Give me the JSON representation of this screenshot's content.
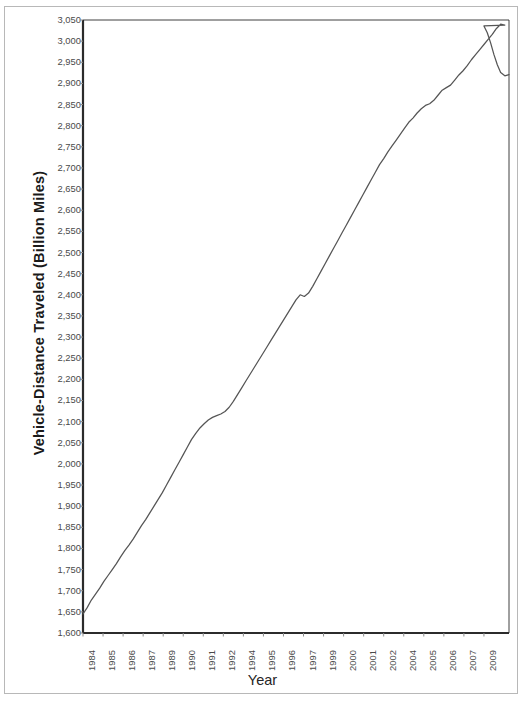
{
  "chart_data": {
    "type": "line",
    "title": "",
    "xlabel": "Year",
    "ylabel": "Vehicle-Distance Traveled (Billion Miles)",
    "ylim": [
      1600,
      3050
    ],
    "xlim": [
      1984,
      2009.5
    ],
    "ytick_step": 50,
    "grid": false,
    "legend": null,
    "ytick_labels": [
      "3,050",
      "3,000",
      "2,950",
      "2,900",
      "2,850",
      "2,800",
      "2,750",
      "2,700",
      "2,650",
      "2,600",
      "2,550",
      "2,500",
      "2,450",
      "2,400",
      "2,350",
      "2,300",
      "2,250",
      "2,200",
      "2,150",
      "2,100",
      "2,050",
      "2,000",
      "1,950",
      "1,900",
      "1,850",
      "1,800",
      "1,750",
      "1,700",
      "1,650",
      "1,600"
    ],
    "ytick_values": [
      3050,
      3000,
      2950,
      2900,
      2850,
      2800,
      2750,
      2700,
      2650,
      2600,
      2550,
      2500,
      2450,
      2400,
      2350,
      2300,
      2250,
      2200,
      2150,
      2100,
      2050,
      2000,
      1950,
      1900,
      1850,
      1800,
      1750,
      1700,
      1650,
      1600
    ],
    "xtick_labels": [
      "1984",
      "1985",
      "1986",
      "1987",
      "1989",
      "1990",
      "1991",
      "1992",
      "1994",
      "1995",
      "1996",
      "1997",
      "1999",
      "2000",
      "2001",
      "2002",
      "2004",
      "2005",
      "2006",
      "2007",
      "2009"
    ],
    "xtick_values": [
      1984.0,
      1985.2,
      1986.4,
      1987.6,
      1988.8,
      1990.0,
      1991.2,
      1992.4,
      1993.6,
      1994.8,
      1996.0,
      1997.2,
      1998.4,
      1999.6,
      2000.8,
      2002.0,
      2003.2,
      2004.4,
      2005.6,
      2006.8,
      2008.0
    ],
    "series": [
      {
        "name": "Vehicle-Distance Traveled",
        "color": "#555555",
        "x": [
          1984.0,
          1984.25,
          1984.5,
          1984.75,
          1985.0,
          1985.25,
          1985.5,
          1985.75,
          1986.0,
          1986.25,
          1986.5,
          1986.75,
          1987.0,
          1987.25,
          1987.5,
          1987.75,
          1988.0,
          1988.25,
          1988.5,
          1988.75,
          1989.0,
          1989.25,
          1989.5,
          1989.75,
          1990.0,
          1990.25,
          1990.5,
          1990.75,
          1991.0,
          1991.25,
          1991.5,
          1991.75,
          1992.0,
          1992.25,
          1992.5,
          1992.75,
          1993.0,
          1993.25,
          1993.5,
          1993.75,
          1994.0,
          1994.25,
          1994.5,
          1994.75,
          1995.0,
          1995.25,
          1995.5,
          1995.75,
          1996.0,
          1996.25,
          1996.5,
          1996.75,
          1997.0,
          1997.25,
          1997.5,
          1997.75,
          1998.0,
          1998.25,
          1998.5,
          1998.75,
          1999.0,
          1999.25,
          1999.5,
          1999.75,
          2000.0,
          2000.25,
          2000.5,
          2000.75,
          2001.0,
          2001.25,
          2001.5,
          2001.75,
          2002.0,
          2002.25,
          2002.5,
          2002.75,
          2003.0,
          2003.25,
          2003.5,
          2003.75,
          2004.0,
          2004.25,
          2004.5,
          2004.75,
          2005.0,
          2005.25,
          2005.5,
          2005.75,
          2006.0,
          2006.25,
          2006.5,
          2006.75,
          2007.0,
          2007.25,
          2007.5,
          2007.75,
          2008.0,
          2008.25,
          2008.5,
          2008.75,
          2009.0,
          2009.25
        ],
        "y": [
          1645,
          1660,
          1678,
          1692,
          1706,
          1722,
          1736,
          1750,
          1764,
          1780,
          1795,
          1808,
          1822,
          1838,
          1854,
          1868,
          1884,
          1900,
          1916,
          1932,
          1950,
          1968,
          1986,
          2004,
          2022,
          2040,
          2058,
          2072,
          2085,
          2095,
          2104,
          2110,
          2114,
          2118,
          2124,
          2134,
          2148,
          2164,
          2180,
          2196,
          2212,
          2228,
          2244,
          2260,
          2276,
          2292,
          2308,
          2324,
          2340,
          2356,
          2372,
          2388,
          2400,
          2396,
          2404,
          2420,
          2438,
          2456,
          2474,
          2492,
          2510,
          2528,
          2546,
          2564,
          2582,
          2600,
          2618,
          2636,
          2654,
          2672,
          2690,
          2708,
          2722,
          2738,
          2752,
          2766,
          2780,
          2794,
          2808,
          2818,
          2830,
          2840,
          2848,
          2852,
          2860,
          2872,
          2884,
          2890,
          2896,
          2908,
          2920,
          2930,
          2942,
          2956,
          2968,
          2980,
          2992,
          3004,
          3016,
          3030,
          3040,
          3038
        ],
        "tail_x": [
          2008.0,
          2008.2,
          2008.4,
          2008.6,
          2008.8,
          2009.0,
          2009.25,
          2009.5
        ],
        "tail_y": [
          3036,
          3020,
          2996,
          2968,
          2944,
          2926,
          2918,
          2921
        ]
      }
    ]
  },
  "axis": {
    "x_axis_title": "Year",
    "y_axis_title": "Vehicle-Distance Traveled (Billion Miles)"
  }
}
